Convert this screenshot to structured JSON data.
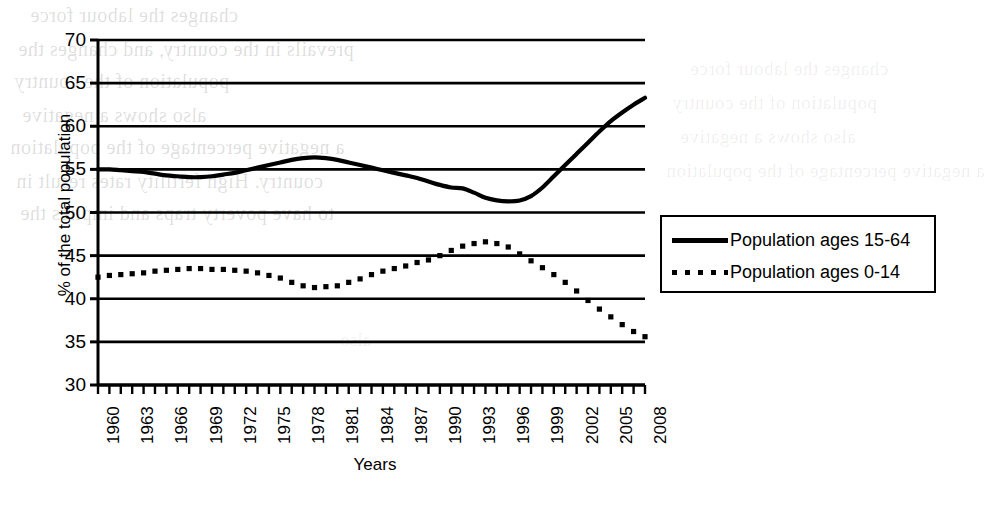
{
  "chart_data": {
    "type": "line",
    "title": "",
    "xlabel": "Years",
    "ylabel": "% of the total population",
    "xlim": [
      1960,
      2008
    ],
    "ylim": [
      30,
      70
    ],
    "ytick_step": 5,
    "yticks": [
      30,
      35,
      40,
      45,
      50,
      55,
      60,
      65,
      70
    ],
    "xticks": [
      1960,
      1963,
      1966,
      1969,
      1972,
      1975,
      1978,
      1981,
      1984,
      1987,
      1990,
      1993,
      1996,
      1999,
      2002,
      2005,
      2008
    ],
    "xtick_minor_step": 1,
    "grid": "horizontal",
    "legend_position": "right-outside",
    "x": [
      1960,
      1961,
      1962,
      1963,
      1964,
      1965,
      1966,
      1967,
      1968,
      1969,
      1970,
      1971,
      1972,
      1973,
      1974,
      1975,
      1976,
      1977,
      1978,
      1979,
      1980,
      1981,
      1982,
      1983,
      1984,
      1985,
      1986,
      1987,
      1988,
      1989,
      1990,
      1991,
      1992,
      1993,
      1994,
      1995,
      1996,
      1997,
      1998,
      1999,
      2000,
      2001,
      2002,
      2003,
      2004,
      2005,
      2006,
      2007,
      2008
    ],
    "series": [
      {
        "name": "Population ages 15-64",
        "style": "solid",
        "color": "#000000",
        "values": [
          55.0,
          55.0,
          54.9,
          54.8,
          54.7,
          54.5,
          54.3,
          54.2,
          54.1,
          54.1,
          54.2,
          54.4,
          54.6,
          54.9,
          55.2,
          55.5,
          55.8,
          56.1,
          56.3,
          56.4,
          56.3,
          56.1,
          55.8,
          55.5,
          55.2,
          54.9,
          54.6,
          54.3,
          54.0,
          53.6,
          53.2,
          52.9,
          52.8,
          52.3,
          51.7,
          51.4,
          51.3,
          51.4,
          51.9,
          52.9,
          54.2,
          55.5,
          56.8,
          58.1,
          59.4,
          60.6,
          61.6,
          62.5,
          63.3
        ]
      },
      {
        "name": "Population ages 0-14",
        "style": "dotted",
        "color": "#000000",
        "values": [
          42.5,
          42.7,
          42.8,
          42.9,
          43.0,
          43.2,
          43.3,
          43.4,
          43.5,
          43.5,
          43.4,
          43.4,
          43.3,
          43.2,
          43.0,
          42.7,
          42.4,
          41.9,
          41.5,
          41.3,
          41.4,
          41.5,
          41.9,
          42.3,
          42.8,
          43.2,
          43.5,
          43.8,
          44.2,
          44.5,
          45.0,
          45.6,
          46.1,
          46.4,
          46.6,
          46.4,
          46.0,
          45.2,
          44.4,
          43.6,
          42.8,
          41.9,
          40.9,
          39.8,
          38.8,
          37.9,
          37.0,
          36.2,
          35.6
        ]
      }
    ],
    "legend": [
      {
        "label": "Population ages 15-64",
        "style": "solid"
      },
      {
        "label": "Population ages 0-14",
        "style": "dotted"
      }
    ]
  },
  "background_showthrough": [
    {
      "text": "changes the labour force"
    },
    {
      "text": "population of the country"
    },
    {
      "text": "also shows a negative"
    },
    {
      "text": "a negative percentage of the population"
    },
    {
      "text": "country. High fertility rates result in"
    },
    {
      "text": "to have poverty traps and implies the"
    },
    {
      "text": "prevails in the country, and changes the"
    },
    {
      "text": "the shows of 1960 to 2008 as the"
    },
    {
      "text": "also"
    }
  ]
}
